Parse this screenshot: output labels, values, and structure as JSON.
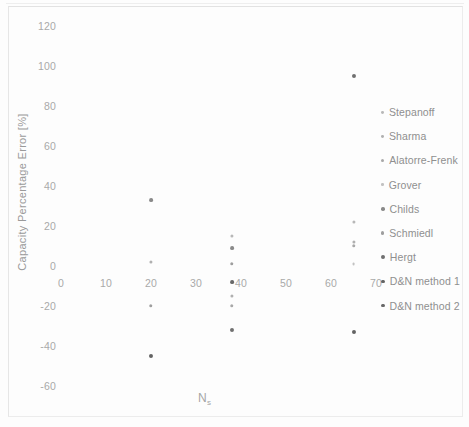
{
  "chart_data": {
    "type": "scatter",
    "title": "",
    "xlabel": "Ns",
    "xlabel_base": "N",
    "xlabel_sub": "s",
    "ylabel": "Capacity Percentage Error [%]",
    "xlim": [
      -5,
      75
    ],
    "ylim": [
      -70,
      128
    ],
    "xticks": [
      0,
      10,
      20,
      30,
      40,
      50,
      60,
      70
    ],
    "yticks": [
      120,
      100,
      80,
      60,
      40,
      20,
      0,
      -20,
      -40,
      -60
    ],
    "grid": false,
    "legend_position": "right",
    "series": [
      {
        "name": "Stepanoff",
        "color": "#b8b8b8",
        "marker_size": 2.2,
        "points": [
          {
            "x": 38,
            "y": 15
          },
          {
            "x": 65,
            "y": 22
          }
        ]
      },
      {
        "name": "Sharma",
        "color": "#b0b0b0",
        "marker_size": 2.2,
        "points": [
          {
            "x": 20,
            "y": 2
          },
          {
            "x": 38,
            "y": -15
          },
          {
            "x": 65,
            "y": 12
          }
        ]
      },
      {
        "name": "Alatorre-Frenk",
        "color": "#a8a8a8",
        "marker_size": 2.4,
        "points": [
          {
            "x": 38,
            "y": -20
          },
          {
            "x": 65,
            "y": 10
          }
        ]
      },
      {
        "name": "Grover",
        "color": "#c2c2c2",
        "marker_size": 2.0,
        "points": [
          {
            "x": 65,
            "y": 1
          }
        ]
      },
      {
        "name": "Childs",
        "color": "#8a8a8a",
        "marker_size": 2.6,
        "points": [
          {
            "x": 20,
            "y": 33
          },
          {
            "x": 38,
            "y": 9
          }
        ]
      },
      {
        "name": "Schmiedl",
        "color": "#9e9e9e",
        "marker_size": 2.4,
        "points": [
          {
            "x": 20,
            "y": -20
          },
          {
            "x": 38,
            "y": 1
          }
        ]
      },
      {
        "name": "Hergt",
        "color": "#707070",
        "marker_size": 2.8,
        "points": [
          {
            "x": 65,
            "y": 95
          },
          {
            "x": 38,
            "y": -32
          }
        ]
      },
      {
        "name": "D&N method 1",
        "color": "#636363",
        "marker_size": 2.8,
        "points": [
          {
            "x": 20,
            "y": -45
          },
          {
            "x": 65,
            "y": -33
          }
        ]
      },
      {
        "name": "D&N method 2",
        "color": "#686868",
        "marker_size": 2.6,
        "points": [
          {
            "x": 38,
            "y": -8
          }
        ]
      }
    ]
  }
}
